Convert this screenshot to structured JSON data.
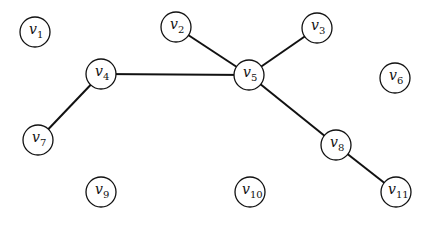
{
  "graph": {
    "node_radius": 15,
    "edge_color": "#111111",
    "nodes": [
      {
        "id": "v1",
        "base": "v",
        "sub": "1",
        "x": 35,
        "y": 32
      },
      {
        "id": "v2",
        "base": "v",
        "sub": "2",
        "x": 176,
        "y": 27
      },
      {
        "id": "v3",
        "base": "v",
        "sub": "3",
        "x": 317,
        "y": 28
      },
      {
        "id": "v4",
        "base": "v",
        "sub": "4",
        "x": 101,
        "y": 74
      },
      {
        "id": "v5",
        "base": "v",
        "sub": "5",
        "x": 249,
        "y": 75
      },
      {
        "id": "v6",
        "base": "v",
        "sub": "6",
        "x": 395,
        "y": 78
      },
      {
        "id": "v7",
        "base": "v",
        "sub": "7",
        "x": 38,
        "y": 140
      },
      {
        "id": "v8",
        "base": "v",
        "sub": "8",
        "x": 336,
        "y": 145
      },
      {
        "id": "v9",
        "base": "v",
        "sub": "9",
        "x": 101,
        "y": 192
      },
      {
        "id": "v10",
        "base": "v",
        "sub": "10",
        "x": 250,
        "y": 192
      },
      {
        "id": "v11",
        "base": "v",
        "sub": "11",
        "x": 396,
        "y": 192
      }
    ],
    "edges": [
      [
        "v2",
        "v5"
      ],
      [
        "v3",
        "v5"
      ],
      [
        "v4",
        "v5"
      ],
      [
        "v4",
        "v7"
      ],
      [
        "v5",
        "v8"
      ],
      [
        "v8",
        "v11"
      ]
    ]
  }
}
